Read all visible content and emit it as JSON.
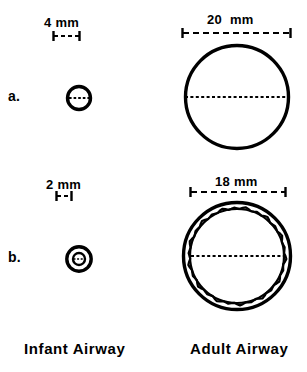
{
  "figure": {
    "background_color": "#ffffff",
    "ink_color": "#000000",
    "width": 307,
    "height": 372
  },
  "columns": [
    {
      "key": "infant",
      "label": "Infant Airway"
    },
    {
      "key": "adult",
      "label": "Adult Airway"
    }
  ],
  "rows": [
    {
      "key": "a",
      "label": "a.",
      "condition": "normal airway"
    },
    {
      "key": "b",
      "label": "b.",
      "condition": "airway narrowed by 1 mm circumferential edema"
    }
  ],
  "dimensions": {
    "infant_normal": {
      "value": "4",
      "unit": "mm",
      "text": "4 mm"
    },
    "adult_normal": {
      "value": "20",
      "unit": "mm",
      "text": "20  mm"
    },
    "infant_edema": {
      "value": "2",
      "unit": "mm",
      "text": "2 mm"
    },
    "adult_edema": {
      "value": "18",
      "unit": "mm",
      "text": "18 mm"
    }
  },
  "chart_data": {
    "type": "diagram",
    "categories": [
      "Infant Airway",
      "Adult Airway"
    ],
    "series": [
      {
        "name": "a. normal lumen diameter (mm)",
        "values": [
          4,
          20
        ]
      },
      {
        "name": "b. edematous lumen diameter (mm)",
        "values": [
          2,
          18
        ]
      }
    ],
    "annotations": [
      "4 mm",
      "20  mm",
      "2 mm",
      "18 mm",
      "a.",
      "b.",
      "Infant Airway",
      "Adult Airway"
    ],
    "units": "mm",
    "legend": "none",
    "grid": false
  },
  "geometry": {
    "infant_a": {
      "cx": 79,
      "cy": 98,
      "r": 12,
      "stroke": 3
    },
    "adult_a": {
      "cx": 237,
      "cy": 97,
      "r": 53,
      "stroke": 3
    },
    "infant_b": {
      "cx": 79,
      "cy": 259,
      "r_outer": 13,
      "r_inner": 7,
      "stroke": 3
    },
    "adult_b": {
      "cx": 237,
      "cy": 256,
      "r_outer": 55,
      "r_inner": 48,
      "stroke": 3
    },
    "bar_4mm": {
      "x1": 53,
      "x2": 80,
      "y": 36
    },
    "bar_20mm": {
      "x1": 182,
      "x2": 291,
      "y": 33
    },
    "bar_2mm": {
      "x1": 56,
      "x2": 72,
      "y": 196
    },
    "bar_18mm": {
      "x1": 190,
      "x2": 286,
      "y": 192
    }
  }
}
